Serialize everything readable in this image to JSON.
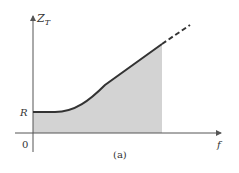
{
  "figure": {
    "caption": "(a)",
    "y_axis_label": "Z",
    "y_axis_label_subscript": "T",
    "x_axis_label": "f",
    "y_tick_label": "R",
    "origin_label": "0"
  },
  "colors": {
    "axis": "#555555",
    "curve": "#333333",
    "fill": "#d3d3d3",
    "text": "#333333"
  }
}
